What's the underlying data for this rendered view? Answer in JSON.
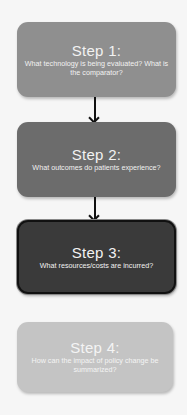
{
  "diagram": {
    "steps": [
      {
        "title": "Step 1:",
        "description": "What technology is being evaluated? What is the comparator?",
        "fill": "#8f8f8f"
      },
      {
        "title": "Step 2:",
        "description": "What outcomes do patients experience?",
        "fill": "#6c6c6c"
      },
      {
        "title": "Step 3:",
        "description": "What resources/costs are incurred?",
        "fill": "#3a3a3a",
        "highlighted": true
      },
      {
        "title": "Step 4:",
        "description": "How can the impact of policy change be summarized?",
        "fill": "#c4c4c4"
      }
    ],
    "connectors": [
      {
        "from": "Step 1",
        "to": "Step 2",
        "type": "arrow"
      },
      {
        "from": "Step 2",
        "to": "Step 3",
        "type": "arrow"
      }
    ]
  }
}
